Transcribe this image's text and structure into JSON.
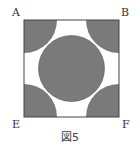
{
  "figure": {
    "caption": "図5",
    "labels": {
      "top_left": "A",
      "top_right": "B",
      "bottom_left": "E",
      "bottom_right": "F"
    },
    "colors": {
      "fill": "#7a7a7a",
      "stroke": "#444444",
      "background": "#ffffff",
      "label": "#333333"
    },
    "geometry": {
      "square": {
        "x": 24,
        "y": 20,
        "width": 95,
        "height": 97
      },
      "center_circle": {
        "cx": 71.5,
        "cy": 68.5,
        "r": 33
      },
      "corner_arcs": [
        {
          "corner": "A",
          "cx": 24,
          "cy": 20,
          "r": 33
        },
        {
          "corner": "B",
          "cx": 119,
          "cy": 20,
          "r": 33
        },
        {
          "corner": "E",
          "cx": 24,
          "cy": 117,
          "r": 33
        },
        {
          "corner": "F",
          "cx": 119,
          "cy": 117,
          "r": 33
        }
      ]
    }
  }
}
